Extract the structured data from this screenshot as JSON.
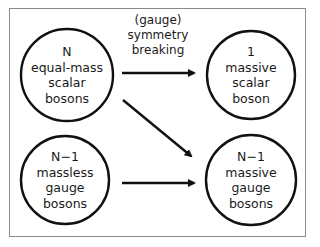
{
  "diagram": {
    "nodes": [
      {
        "id": "n_equal_mass_scalar",
        "lines": [
          "N",
          "equal-mass",
          "scalar",
          "bosons"
        ]
      },
      {
        "id": "one_massive_scalar",
        "lines": [
          "1",
          "massive",
          "scalar",
          "boson"
        ]
      },
      {
        "id": "n1_massless_gauge",
        "lines": [
          "N−1",
          "massless",
          "gauge",
          "bosons"
        ]
      },
      {
        "id": "n1_massive_gauge",
        "lines": [
          "N−1",
          "massive",
          "gauge",
          "bosons"
        ]
      }
    ],
    "edge_label": [
      "(gauge)",
      "symmetry",
      "breaking"
    ],
    "edges": [
      {
        "from": "n_equal_mass_scalar",
        "to": "one_massive_scalar"
      },
      {
        "from": "n_equal_mass_scalar",
        "to": "n1_massive_gauge"
      },
      {
        "from": "n1_massless_gauge",
        "to": "n1_massive_gauge"
      }
    ],
    "colors": {
      "stroke": "#111111",
      "border": "#8a8a8a",
      "background": "#ffffff"
    }
  }
}
